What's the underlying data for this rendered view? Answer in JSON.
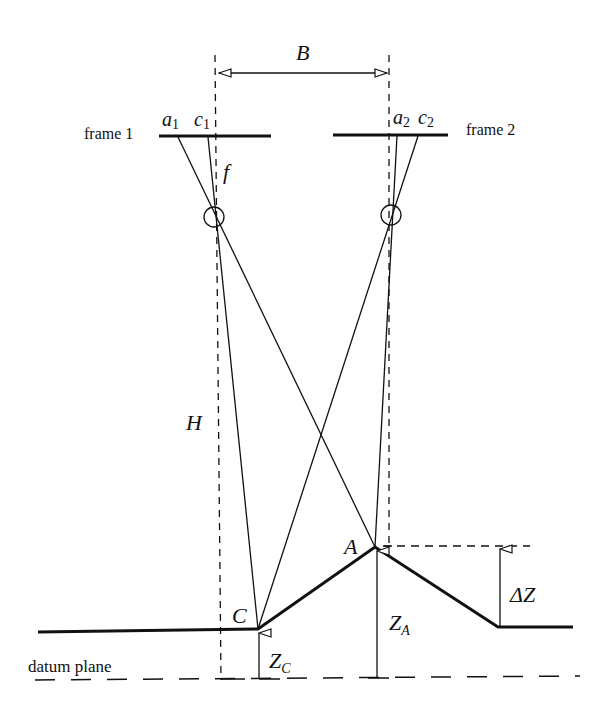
{
  "diagram": {
    "labels": {
      "baseline": "B",
      "frame1": "frame 1",
      "frame2": "frame 2",
      "a1_main": "a",
      "a1_sub": "1",
      "c1_main": "c",
      "c1_sub": "1",
      "a2_main": "a",
      "a2_sub": "2",
      "c2_main": "c",
      "c2_sub": "2",
      "focal": "f",
      "height": "H",
      "pointA": "A",
      "pointC": "C",
      "zA_main": "Z",
      "zA_sub": "A",
      "zC_main": "Z",
      "zC_sub": "C",
      "deltaZ": "ΔZ",
      "datum": "datum plane"
    },
    "colors": {
      "stroke": "#111111",
      "background": "#ffffff"
    }
  }
}
